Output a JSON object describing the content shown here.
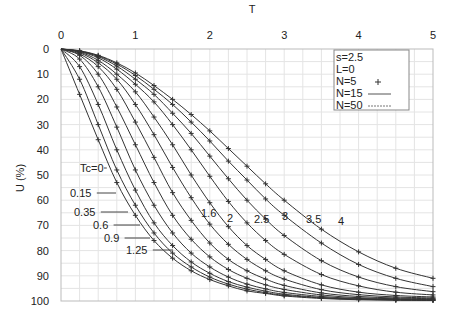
{
  "chart_data": {
    "type": "line",
    "title": "",
    "xlabel": "T",
    "ylabel": "U (%)",
    "xlim": [
      0,
      5
    ],
    "ylim": [
      0,
      100
    ],
    "y_inverted": true,
    "x_axis_position": "top",
    "xticks": [
      "0",
      "1",
      "2",
      "3",
      "4",
      "5"
    ],
    "yticks": [
      "0",
      "10",
      "20",
      "30",
      "40",
      "50",
      "60",
      "70",
      "80",
      "90",
      "100"
    ],
    "grid": true,
    "legend": {
      "position": "top-right",
      "entries": [
        {
          "text": "s=2.5"
        },
        {
          "text": "L=0"
        },
        {
          "text": "N=5",
          "symbol": "+"
        },
        {
          "text": "N=15",
          "symbol": "solid-line"
        },
        {
          "text": "N=50",
          "symbol": "dashed-line"
        }
      ]
    },
    "x": [
      0,
      0.25,
      0.5,
      0.75,
      1,
      1.25,
      1.5,
      1.75,
      2,
      2.25,
      2.5,
      2.75,
      3,
      3.5,
      4,
      4.5,
      5
    ],
    "series": [
      {
        "name": "Tc=0",
        "label": "Tc=0",
        "values": [
          0,
          18,
          36,
          53,
          66,
          76,
          83,
          88,
          91.5,
          94,
          96,
          97,
          98,
          99,
          99.5,
          99.7,
          99.8
        ]
      },
      {
        "name": "Tc=0.15",
        "label": "0.15",
        "values": [
          0,
          12,
          30,
          48,
          62,
          73,
          81,
          86.5,
          90.5,
          93.3,
          95.3,
          96.7,
          97.7,
          98.8,
          99.3,
          99.6,
          99.7
        ]
      },
      {
        "name": "Tc=0.35",
        "label": "0.35",
        "values": [
          0,
          7,
          22,
          40,
          56,
          69,
          78,
          84.5,
          89,
          92.3,
          94.5,
          96.1,
          97.3,
          98.6,
          99.2,
          99.5,
          99.6
        ]
      },
      {
        "name": "Tc=0.6",
        "label": "0.6",
        "values": [
          0,
          4,
          15,
          31,
          48,
          62,
          73,
          81,
          86.5,
          90.5,
          93.3,
          95.2,
          96.6,
          98.2,
          99,
          99.3,
          99.5
        ]
      },
      {
        "name": "Tc=0.9",
        "label": "0.9",
        "values": [
          0,
          2.5,
          10,
          23,
          38,
          53,
          66,
          75.5,
          82.5,
          87.5,
          91,
          93.6,
          95.4,
          97.6,
          98.7,
          99.1,
          99.3
        ]
      },
      {
        "name": "Tc=1.25",
        "label": "1.25",
        "values": [
          0,
          2,
          7,
          16,
          29,
          43,
          57,
          68,
          77,
          83.5,
          88,
          91.3,
          93.8,
          96.8,
          98.2,
          98.8,
          99.1
        ]
      },
      {
        "name": "Tc=1.6",
        "label": "1.6",
        "values": [
          0,
          1.5,
          5.5,
          12,
          22,
          34,
          47,
          59,
          69.5,
          77.5,
          83.5,
          88,
          91.3,
          95.5,
          97.5,
          98.4,
          98.8
        ]
      },
      {
        "name": "Tc=2",
        "label": "2",
        "values": [
          0,
          1.2,
          4.5,
          10,
          17,
          27,
          38,
          50,
          61,
          70.5,
          78,
          83.5,
          88,
          93.6,
          96.5,
          97.8,
          98.4
        ]
      },
      {
        "name": "Tc=2.5",
        "label": "2.5",
        "values": [
          0,
          1,
          3.5,
          8,
          14,
          21,
          30,
          40,
          50.5,
          60.5,
          69,
          76,
          81.5,
          89.5,
          94,
          96.5,
          97.6
        ]
      },
      {
        "name": "Tc=3",
        "label": "3",
        "values": [
          0,
          0.9,
          3,
          6.8,
          12,
          18,
          25.5,
          33.5,
          42.5,
          51.5,
          60,
          67.5,
          74,
          84,
          90.5,
          94.3,
          96.3
        ]
      },
      {
        "name": "Tc=3.5",
        "label": "3.5",
        "values": [
          0,
          0.8,
          2.7,
          6,
          10.5,
          16,
          22,
          29,
          36.5,
          44.5,
          52,
          59.5,
          66,
          77,
          85.5,
          91,
          94.3
        ]
      },
      {
        "name": "Tc=4",
        "label": "4",
        "values": [
          0,
          0.7,
          2.5,
          5.5,
          9.5,
          14.5,
          20,
          26,
          32.5,
          39.5,
          46.5,
          53.5,
          60,
          71.5,
          80.5,
          87,
          91
        ]
      }
    ],
    "label_positions": [
      {
        "label": "Tc=0",
        "text_x": 80,
        "text_y": 172,
        "line_to_x": 104
      },
      {
        "label": "0.15",
        "text_x": 70,
        "text_y": 197,
        "line_to_x": 116
      },
      {
        "label": "0.35",
        "text_x": 74,
        "text_y": 216,
        "line_to_x": 128
      },
      {
        "label": "0.6",
        "text_x": 93,
        "text_y": 229,
        "line_to_x": 140
      },
      {
        "label": "0.9",
        "text_x": 104,
        "text_y": 242,
        "line_to_x": 150
      },
      {
        "label": "1.25",
        "text_x": 126,
        "text_y": 254,
        "line_to_x": 173
      },
      {
        "label": "1.6",
        "text_x": 201,
        "text_y": 217
      },
      {
        "label": "2",
        "text_x": 227,
        "text_y": 222
      },
      {
        "label": "2.5",
        "text_x": 254,
        "text_y": 223
      },
      {
        "label": "3",
        "text_x": 282,
        "text_y": 220
      },
      {
        "label": "3.5",
        "text_x": 306,
        "text_y": 223
      },
      {
        "label": "4",
        "text_x": 338,
        "text_y": 225
      }
    ]
  }
}
